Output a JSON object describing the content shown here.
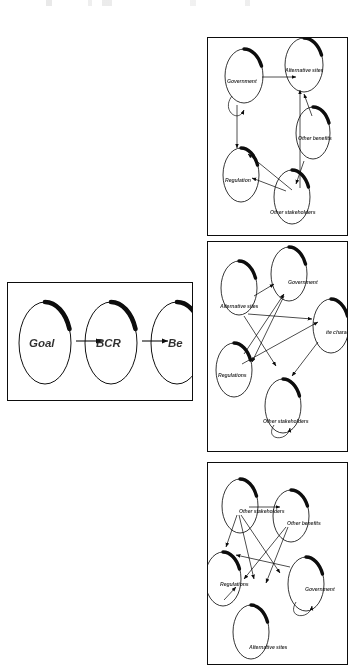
{
  "figure": {
    "background_color": "#ffffff",
    "ink_color": "#111111",
    "width": 357,
    "height": 668
  },
  "flow_box": {
    "name": "goal-bcr-benefit-flow",
    "nodes": [
      {
        "id": "goal",
        "label": "Goal",
        "cx": 44,
        "cy": 342,
        "rx": 26,
        "ry": 41
      },
      {
        "id": "bcr",
        "label": "BCR",
        "cx": 110,
        "cy": 342,
        "rx": 26,
        "ry": 41
      },
      {
        "id": "benefit",
        "label": "Be",
        "cx": 176,
        "cy": 342,
        "rx": 26,
        "ry": 41
      }
    ],
    "arrows": [
      {
        "from": "goal",
        "to": "bcr",
        "x1": 75,
        "y1": 340,
        "x2": 101,
        "y2": 340
      },
      {
        "from": "bcr",
        "to": "benefit",
        "x1": 141,
        "y1": 340,
        "x2": 167,
        "y2": 340
      }
    ]
  },
  "panels": [
    {
      "id": "panel-1",
      "nodes": [
        {
          "id": "government",
          "label": "Government",
          "cx": 243,
          "cy": 75,
          "rx": 19,
          "ry": 27
        },
        {
          "id": "alternative-sites",
          "label": "Alternative sites",
          "cx": 303,
          "cy": 64,
          "rx": 19,
          "ry": 27
        },
        {
          "id": "other-benefits",
          "label": "Other benefits",
          "cx": 312,
          "cy": 132,
          "rx": 17,
          "ry": 26
        },
        {
          "id": "regulation",
          "label": "Regulation",
          "cx": 240,
          "cy": 174,
          "rx": 18,
          "ry": 27
        },
        {
          "id": "other-stakeholders",
          "label": "Other stakeholders",
          "cx": 291,
          "cy": 196,
          "rx": 18,
          "ry": 27
        }
      ],
      "edges": [
        {
          "from": "government",
          "to": "alternative-sites"
        },
        {
          "from": "government",
          "to": "regulation"
        },
        {
          "from": "government",
          "to": "government",
          "self_loop": true
        },
        {
          "from": "other-stakeholders",
          "to": "government"
        },
        {
          "from": "other-stakeholders",
          "to": "regulation"
        },
        {
          "from": "other-stakeholders",
          "to": "alternative-sites"
        },
        {
          "from": "other-benefits",
          "to": "alternative-sites"
        },
        {
          "from": "other-stakeholders",
          "to": "other-benefits"
        }
      ]
    },
    {
      "id": "panel-2",
      "nodes": [
        {
          "id": "alternative-sites",
          "label": "Alternative sites",
          "cx": 238,
          "cy": 287,
          "rx": 18,
          "ry": 27
        },
        {
          "id": "government",
          "label": "Government",
          "cx": 288,
          "cy": 273,
          "rx": 18,
          "ry": 27
        },
        {
          "id": "site-characteristics",
          "label": "ite charact",
          "cx": 330,
          "cy": 325,
          "rx": 18,
          "ry": 27
        },
        {
          "id": "regulations",
          "label": "Regulations",
          "cx": 233,
          "cy": 369,
          "rx": 18,
          "ry": 27
        },
        {
          "id": "other-stakeholders",
          "label": "Other stakeholders",
          "cx": 282,
          "cy": 405,
          "rx": 18,
          "ry": 27
        }
      ],
      "edges": [
        {
          "from": "alternative-sites",
          "to": "government"
        },
        {
          "from": "regulations",
          "to": "government"
        },
        {
          "from": "regulations",
          "to": "site-characteristics"
        },
        {
          "from": "alternative-sites",
          "to": "other-stakeholders"
        },
        {
          "from": "alternative-sites",
          "to": "site-characteristics"
        },
        {
          "from": "site-characteristics",
          "to": "other-stakeholders"
        },
        {
          "from": "government",
          "to": "regulations"
        },
        {
          "from": "other-stakeholders",
          "to": "other-stakeholders",
          "self_loop": true
        }
      ]
    },
    {
      "id": "panel-3",
      "nodes": [
        {
          "id": "other-stakeholders",
          "label": "Other stakeholders",
          "cx": 239,
          "cy": 505,
          "rx": 18,
          "ry": 27
        },
        {
          "id": "other-benefits",
          "label": "Other benefits",
          "cx": 290,
          "cy": 515,
          "rx": 18,
          "ry": 26
        },
        {
          "id": "regulations",
          "label": "Regulations",
          "cx": 222,
          "cy": 578,
          "rx": 18,
          "ry": 27
        },
        {
          "id": "government",
          "label": "Government",
          "cx": 305,
          "cy": 583,
          "rx": 18,
          "ry": 27
        },
        {
          "id": "alternative-sites",
          "label": "Alternative sites",
          "cx": 250,
          "cy": 631,
          "rx": 18,
          "ry": 27
        }
      ],
      "edges": [
        {
          "from": "other-stakeholders",
          "to": "other-benefits"
        },
        {
          "from": "other-stakeholders",
          "to": "regulations"
        },
        {
          "from": "other-stakeholders",
          "to": "government"
        },
        {
          "from": "other-stakeholders",
          "to": "alternative-sites"
        },
        {
          "from": "other-benefits",
          "to": "regulations"
        },
        {
          "from": "other-benefits",
          "to": "alternative-sites"
        },
        {
          "from": "government",
          "to": "regulations"
        },
        {
          "from": "government",
          "to": "government",
          "self_loop": true
        },
        {
          "from": "regulations",
          "to": "alternative-sites"
        }
      ]
    }
  ]
}
